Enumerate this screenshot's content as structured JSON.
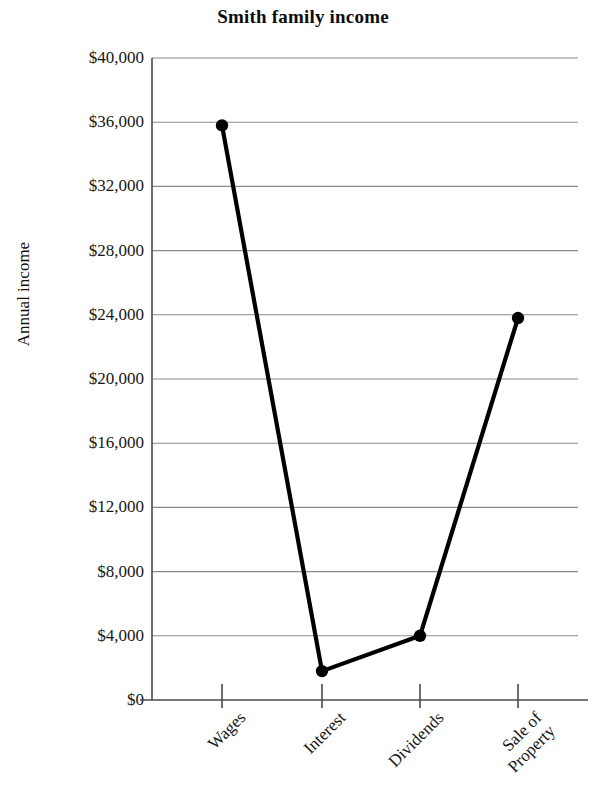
{
  "chart_data": {
    "type": "line",
    "title": "Smith family income",
    "xlabel": "",
    "ylabel": "Annual income",
    "categories": [
      "Wages",
      "Interest",
      "Dividends",
      "Sale of Property"
    ],
    "values": [
      35800,
      1800,
      4000,
      23800
    ],
    "series": [
      {
        "name": "Annual income",
        "values": [
          35800,
          1800,
          4000,
          23800
        ]
      }
    ],
    "ylim": [
      0,
      40000
    ],
    "ytick_values": [
      0,
      4000,
      8000,
      12000,
      16000,
      20000,
      24000,
      28000,
      32000,
      36000,
      40000
    ],
    "ytick_labels": [
      "$0",
      "$4,000",
      "$8,000",
      "$12,000",
      "$16,000",
      "$20,000",
      "$24,000",
      "$28,000",
      "$32,000",
      "$36,000",
      "$40,000"
    ],
    "grid": true,
    "grid_axis": "y",
    "legend": false,
    "legend_position": "none",
    "marker": "circle",
    "line_color": "#000000",
    "grid_color": "#8a8a8a",
    "axis_color": "#4a4a4a",
    "background_color": "#ffffff",
    "xtick_rotation": -45,
    "xtick_label_lines": [
      [
        "Wages"
      ],
      [
        "Interest"
      ],
      [
        "Dividends"
      ],
      [
        "Sale of",
        "Property"
      ]
    ]
  }
}
